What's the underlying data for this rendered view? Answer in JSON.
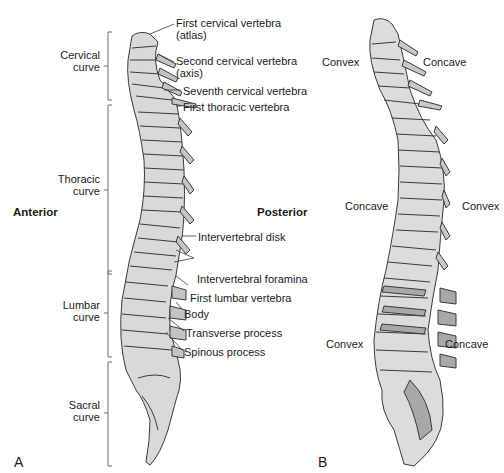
{
  "figure": {
    "panel_a": {
      "letter": "A",
      "orientation": {
        "left": "Anterior",
        "right": "Posterior"
      },
      "curves": [
        {
          "line1": "Cervical",
          "line2": "curve"
        },
        {
          "line1": "Thoracic",
          "line2": "curve"
        },
        {
          "line1": "Lumbar",
          "line2": "curve"
        },
        {
          "line1": "Sacral",
          "line2": "curve"
        }
      ],
      "callouts": [
        {
          "line1": "First cervical vertebra",
          "line2": "(atlas)"
        },
        {
          "line1": "Second cervical vertebra",
          "line2": "(axis)"
        },
        {
          "line1": "Seventh cervical vertebra"
        },
        {
          "line1": "First thoracic vertebra"
        },
        {
          "line1": "Intervertebral disk"
        },
        {
          "line1": "Intervertebral foramina"
        },
        {
          "line1": "First lumbar vertebra"
        },
        {
          "line1": "Body"
        },
        {
          "line1": "Transverse process"
        },
        {
          "line1": "Spinous process"
        }
      ]
    },
    "panel_b": {
      "letter": "B",
      "labels": [
        {
          "left": "Convex",
          "right": "Concave"
        },
        {
          "left": "Concave",
          "right": "Convex"
        },
        {
          "left": "Convex",
          "right": "Concave"
        }
      ]
    },
    "colors": {
      "bone_fill": "#d9d9d9",
      "bone_shade": "#a8a8a8",
      "outline": "#3a3a3a",
      "text": "#1a1a1a"
    }
  }
}
